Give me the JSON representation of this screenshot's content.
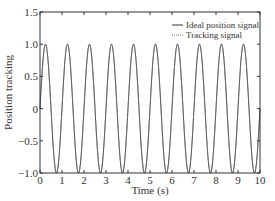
{
  "chart_data": {
    "type": "line",
    "title": "",
    "xlabel": "Time (s)",
    "ylabel": "Position tracking",
    "xlim": [
      0,
      10
    ],
    "ylim": [
      -1.0,
      1.5
    ],
    "xticks": [
      "0",
      "1",
      "2",
      "3",
      "4",
      "5",
      "6",
      "7",
      "8",
      "9",
      "10"
    ],
    "yticks": [
      "1.5",
      "1.0",
      "0.5",
      "0",
      "-0.5",
      "-1.0"
    ],
    "grid": false,
    "legend_position": "upper right",
    "series": [
      {
        "name": "Ideal position signal",
        "style": "solid",
        "function": "sin(2*pi*t)",
        "frequency_hz": 1,
        "amplitude": 1.0
      },
      {
        "name": "Tracking signal",
        "style": "dotted",
        "function": "sin(2*pi*t)",
        "frequency_hz": 1,
        "amplitude": 1.0
      }
    ]
  }
}
